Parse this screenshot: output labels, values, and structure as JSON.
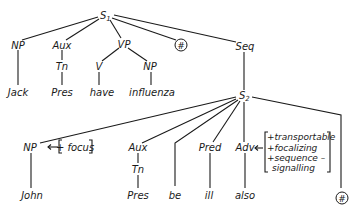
{
  "diagram": {
    "type": "syntax-tree",
    "root": {
      "label": "S",
      "subscript": "1",
      "children": [
        {
          "label": "NP",
          "children": [
            {
              "label": "Jack"
            }
          ]
        },
        {
          "label": "Aux",
          "children": [
            {
              "label": "Tn",
              "children": [
                {
                  "label": "Pres"
                }
              ]
            }
          ]
        },
        {
          "label": "VP",
          "children": [
            {
              "label": "V",
              "children": [
                {
                  "label": "have"
                }
              ]
            },
            {
              "label": "NP",
              "children": [
                {
                  "label": "influenza"
                }
              ]
            }
          ]
        },
        {
          "label": "#",
          "circled": true
        },
        {
          "label": "Seq",
          "children": [
            {
              "label": "S",
              "subscript": "2",
              "children": [
                {
                  "label": "NP",
                  "feature": "[+ focus]",
                  "children": [
                    {
                      "label": "John"
                    }
                  ]
                },
                {
                  "label": "Aux",
                  "children": [
                    {
                      "label": "Tn",
                      "children": [
                        {
                          "label": "Pres"
                        }
                      ]
                    }
                  ]
                },
                {
                  "label": "be"
                },
                {
                  "label": "Pred",
                  "children": [
                    {
                      "label": "ill"
                    }
                  ]
                },
                {
                  "label": "Adv",
                  "features": [
                    "+transportable",
                    "+focalizing",
                    "+sequence –",
                    "signalling"
                  ],
                  "children": [
                    {
                      "label": "also"
                    }
                  ]
                },
                {
                  "label": "#",
                  "circled": true
                }
              ]
            }
          ]
        }
      ]
    }
  },
  "labels": {
    "s1": "S",
    "s1_sub": "1",
    "np1": "NP",
    "aux1": "Aux",
    "vp": "VP",
    "hash1": "#",
    "seq": "Seq",
    "tn1": "Tn",
    "v": "V",
    "np2": "NP",
    "jack": "Jack",
    "pres1": "Pres",
    "have": "have",
    "influenza": "influenza",
    "s2": "S",
    "s2_sub": "2",
    "np3": "NP",
    "focus": "+ focus",
    "aux2": "Aux",
    "pred": "Pred",
    "adv": "Adv",
    "feat1": "+transportable",
    "feat2": "+focalizing",
    "feat3": "+sequence –",
    "feat4": "signalling",
    "tn2": "Tn",
    "john": "John",
    "pres2": "Pres",
    "be": "be",
    "ill": "ill",
    "also": "also",
    "hash2": "#"
  }
}
